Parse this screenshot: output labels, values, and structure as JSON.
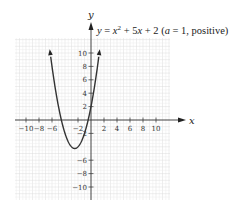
{
  "chart_data": {
    "type": "line",
    "equation": {
      "lhs": "y",
      "rhs_prefix": "x",
      "exp": "2",
      "rhs_suffix": " + 5x + 2",
      "note": " (a = 1, positive)"
    },
    "xlabel": "x",
    "ylabel": "y",
    "xlim": [
      -12,
      12
    ],
    "ylim": [
      -12,
      12
    ],
    "x_ticks": [
      -10,
      -8,
      -6,
      -2,
      2,
      4,
      6,
      8,
      10
    ],
    "x_tick_labels": [
      "−10",
      "−8",
      "−6",
      "−2",
      "2",
      "4",
      "6",
      "8",
      "10"
    ],
    "y_ticks": [
      10,
      8,
      6,
      4,
      2,
      -2,
      -6,
      -8,
      -10
    ],
    "y_tick_labels": [
      "10",
      "8",
      "6",
      "4",
      "2",
      "−2",
      "−6",
      "−8",
      "−10"
    ],
    "grid": true,
    "series": [
      {
        "name": "y = x^2 + 5x + 2",
        "coefficients": {
          "a": 1,
          "b": 5,
          "c": 2
        },
        "vertex": [
          -2.5,
          -4.25
        ],
        "x": [
          -6.2,
          -6,
          -5,
          -4,
          -3,
          -2.5,
          -2,
          -1,
          0,
          1,
          1.2
        ],
        "values": [
          9.44,
          8,
          2,
          -2,
          -4,
          -4.25,
          -4,
          -2,
          2,
          8,
          9.44
        ]
      }
    ]
  }
}
